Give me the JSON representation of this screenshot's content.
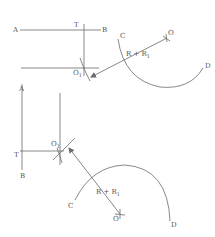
{
  "figure": {
    "stroke_color": "#6a6a6a",
    "label_color": "#555555",
    "top": {
      "labels": {
        "A": "A",
        "T": "T",
        "B": "B",
        "O1": "O",
        "O1_sub": "1",
        "C": "C",
        "R": "R + R",
        "R_sub": "1",
        "O": "O",
        "D": "D"
      }
    },
    "bottom": {
      "labels": {
        "A": "A",
        "T": "T",
        "B": "B",
        "O1": "O",
        "O1_sub": "1",
        "C": "C",
        "R": "R + R",
        "R_sub": "1",
        "O": "O",
        "D": "D"
      }
    }
  }
}
